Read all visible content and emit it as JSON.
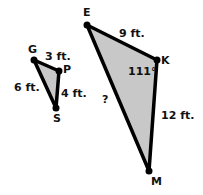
{
  "small_triangle": {
    "vertices": {
      "G": "G",
      "P": "P",
      "S": "S"
    },
    "sides": {
      "GP": "3 ft.",
      "GS": "6 ft.",
      "PS": "4 ft."
    }
  },
  "large_triangle": {
    "vertices": {
      "E": "E",
      "K": "K",
      "M": "M"
    },
    "sides": {
      "EK": "9 ft.",
      "KM": "12 ft.",
      "EM": "?"
    },
    "angle_K": "111°"
  },
  "colors": {
    "fill": "#c8c8c8",
    "stroke": "#000000"
  }
}
